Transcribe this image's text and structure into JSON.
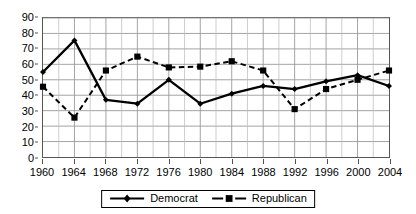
{
  "chart_data": {
    "type": "line",
    "title": "",
    "subtitle": "",
    "xlabel": "",
    "ylabel": "",
    "x": [
      1960,
      1964,
      1968,
      1972,
      1976,
      1980,
      1984,
      1988,
      1992,
      1996,
      2000,
      2004
    ],
    "categories": [
      "1960",
      "1964",
      "1968",
      "1972",
      "1976",
      "1980",
      "1984",
      "1988",
      "1992",
      "1996",
      "2000",
      "2004"
    ],
    "series": [
      {
        "name": "Democrat",
        "line_style": "solid",
        "marker": "diamond",
        "color": "#000000",
        "values": [
          55,
          75.5,
          37,
          34.5,
          50,
          34.5,
          41,
          46,
          44,
          49,
          53,
          46
        ]
      },
      {
        "name": "Republican",
        "line_style": "dashed",
        "marker": "square",
        "color": "#000000",
        "values": [
          45.5,
          25.5,
          56,
          65,
          58,
          58.5,
          62,
          56,
          31,
          44,
          50,
          56
        ]
      }
    ],
    "ylim": [
      0,
      90
    ],
    "ytick_step": 10,
    "yticks": [
      0,
      10,
      20,
      30,
      40,
      50,
      60,
      70,
      80,
      90
    ],
    "ytick_labels": [
      "0",
      "10",
      "20",
      "30",
      "40",
      "50",
      "60",
      "70",
      "80",
      "90"
    ],
    "xlim": [
      1960,
      2004
    ],
    "xtick_step": 4,
    "xtick_minor_step": 2,
    "grid": true,
    "grid_color": "#999999",
    "grid_minor_color": "#b8b8b8",
    "axis_color": "#555555",
    "legend": {
      "position": "bottom",
      "entries": [
        {
          "label": "Democrat",
          "style": "solid",
          "marker": "diamond"
        },
        {
          "label": "Republican",
          "style": "dashed",
          "marker": "square"
        }
      ]
    }
  }
}
